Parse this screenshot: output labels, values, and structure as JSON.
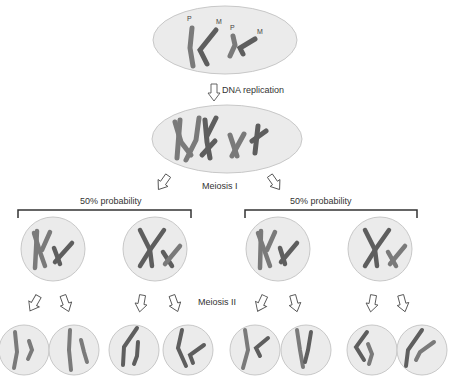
{
  "labels": {
    "dna_replication": "DNA replication",
    "meiosis_1": "Meiosis I",
    "meiosis_2": "Meiosis II",
    "prob_left": "50% probability",
    "prob_right": "50% probability",
    "paternal": "P",
    "maternal": "M"
  },
  "colors": {
    "cell_fill": "#ebebeb",
    "cell_stroke": "#c8c8c8",
    "paternal_chromosome": "#7a7a7a",
    "maternal_chromosome": "#5e5e5e",
    "bracket": "#333333"
  }
}
